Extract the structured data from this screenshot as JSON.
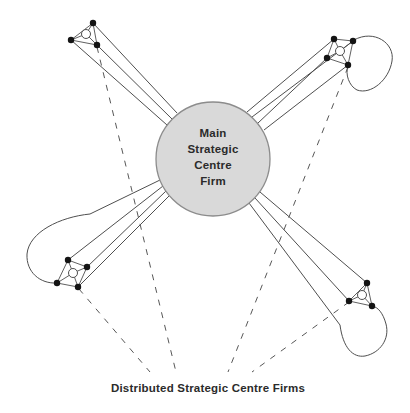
{
  "center_firm": {
    "label_lines": [
      "Main",
      "Strategic",
      "Centre",
      "Firm"
    ]
  },
  "bottom_label": "Distributed Strategic Centre Firms",
  "colors": {
    "circle_fill": "#d9d9d9",
    "circle_stroke": "#8c8c8c",
    "line": "#4f4f4f",
    "dashed_line": "#575757",
    "node_dot": "#141414",
    "text": "#2b2b2b",
    "background": "#ffffff"
  },
  "clusters": [
    {
      "position": "top-left",
      "outer_nodes": 3,
      "hub_node": true,
      "links_to_centre": 3,
      "loop": false,
      "dashed_link_to_distributed_label": true
    },
    {
      "position": "top-right",
      "outer_nodes": 4,
      "hub_node": true,
      "links_to_centre": 4,
      "loop": true,
      "dashed_link_to_distributed_label": true
    },
    {
      "position": "bottom-left",
      "outer_nodes": 4,
      "hub_node": true,
      "links_to_centre": 4,
      "loop": true,
      "dashed_link_to_distributed_label": true
    },
    {
      "position": "bottom-right",
      "outer_nodes": 3,
      "hub_node": true,
      "links_to_centre": 3,
      "loop": true,
      "dashed_link_to_distributed_label": true
    }
  ]
}
